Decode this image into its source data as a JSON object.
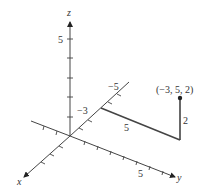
{
  "diagram": {
    "type": "3d-coordinate-axes",
    "axes": {
      "x_label": "x",
      "y_label": "y",
      "z_label": "z"
    },
    "tick_labels": {
      "z_pos": "5",
      "y_pos": "5",
      "x_neg_3": "−3",
      "x_neg_5": "−5"
    },
    "path_segments": {
      "along_y_length": "5",
      "along_z_length": "2"
    },
    "point": {
      "label": "(−3, 5, 2)",
      "coords": [
        -3,
        5,
        2
      ]
    },
    "colors": {
      "line": "#444444",
      "text": "#333333",
      "background": "#ffffff"
    }
  }
}
